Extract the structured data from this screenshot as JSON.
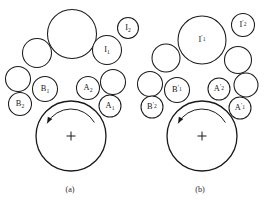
{
  "figure": {
    "background_color": "#ffffff",
    "stroke_color": "#1a1a1a",
    "width": 267,
    "height": 203,
    "panels": [
      {
        "id": "panel-a",
        "caption": "(a)",
        "caption_x": 70,
        "caption_y": 192,
        "carrier": {
          "cx": 71,
          "cy": 136,
          "r": 35,
          "center_mark": "plus",
          "mark_size": 9
        },
        "rotation_arrow": {
          "direction": "counterclockwise",
          "cx": 71,
          "cy": 136,
          "r": 27,
          "start_deg": -30,
          "end_deg": -152,
          "head_deg": -152
        },
        "circles": [
          {
            "name": "top-large-idler",
            "cx": 72,
            "cy": 34,
            "r": 24.5,
            "label": null
          },
          {
            "name": "upper-left-idler",
            "cx": 37,
            "cy": 53,
            "r": 14.5,
            "label": null
          },
          {
            "name": "left-idler",
            "cx": 18,
            "cy": 79,
            "r": 12.5,
            "label": null
          },
          {
            "name": "idler-B2",
            "cx": 20,
            "cy": 104,
            "r": 11.5,
            "label": "B",
            "sub": "2"
          },
          {
            "name": "idler-B1",
            "cx": 45,
            "cy": 89,
            "r": 12.5,
            "label": "B",
            "sub": "1"
          },
          {
            "name": "idler-A2",
            "cx": 88,
            "cy": 88,
            "r": 11.5,
            "label": "A",
            "sub": "2"
          },
          {
            "name": "right-idler",
            "cx": 113,
            "cy": 82,
            "r": 12.5,
            "label": null
          },
          {
            "name": "idler-A1",
            "cx": 110,
            "cy": 106,
            "r": 11.0,
            "label": "A",
            "sub": "1"
          },
          {
            "name": "idler-I1",
            "cx": 107,
            "cy": 50,
            "r": 14.5,
            "label": "I",
            "sub": "1"
          },
          {
            "name": "idler-I2",
            "cx": 128,
            "cy": 28,
            "r": 10.5,
            "label": "I",
            "sub": "2"
          }
        ]
      },
      {
        "id": "panel-b",
        "caption": "(b)",
        "caption_x": 200,
        "caption_y": 192,
        "carrier": {
          "cx": 202,
          "cy": 136,
          "r": 35,
          "center_mark": "plus",
          "mark_size": 9
        },
        "rotation_arrow": {
          "direction": "counterclockwise",
          "cx": 202,
          "cy": 136,
          "r": 27,
          "start_deg": -30,
          "end_deg": -152,
          "head_deg": -152
        },
        "circles": [
          {
            "name": "idler-I1-prime",
            "cx": 202,
            "cy": 40,
            "r": 24.0,
            "label": "I",
            "sub": "1",
            "prime": true
          },
          {
            "name": "idler-I2-prime",
            "cx": 243,
            "cy": 25,
            "r": 11.5,
            "label": "I",
            "sub": "2",
            "prime": true
          },
          {
            "name": "upper-left-idler-b",
            "cx": 166,
            "cy": 58,
            "r": 14.0,
            "label": null
          },
          {
            "name": "left-idler-b",
            "cx": 150,
            "cy": 84,
            "r": 12.5,
            "label": null
          },
          {
            "name": "idler-B2-prime",
            "cx": 152,
            "cy": 107,
            "r": 11.0,
            "label": "B",
            "sub": "2",
            "prime": true
          },
          {
            "name": "idler-B1-prime",
            "cx": 177,
            "cy": 90,
            "r": 12.5,
            "label": "B",
            "sub": "1",
            "prime": true
          },
          {
            "name": "idler-A2-prime",
            "cx": 219,
            "cy": 89,
            "r": 11.0,
            "label": "A",
            "sub": "2",
            "prime": true
          },
          {
            "name": "upper-right-idler-b",
            "cx": 238,
            "cy": 60,
            "r": 13.5,
            "label": null
          },
          {
            "name": "right-idler-b",
            "cx": 246,
            "cy": 85,
            "r": 12.0,
            "label": null
          },
          {
            "name": "idler-A1-prime",
            "cx": 240,
            "cy": 108,
            "r": 11.0,
            "label": "A",
            "sub": "1",
            "prime": true
          }
        ]
      }
    ]
  }
}
